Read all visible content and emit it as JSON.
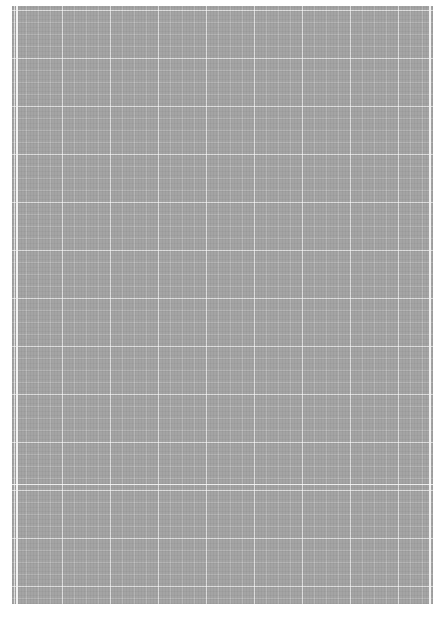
{
  "document": {
    "type": "blank graph paper scan",
    "text": "",
    "colors": {
      "paper": "#a4a4a4",
      "grid_lines": "#ffffff",
      "margin": "#ffffff"
    }
  }
}
